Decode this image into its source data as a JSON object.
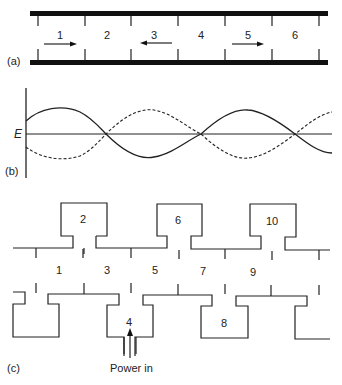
{
  "figure": {
    "panels": [
      {
        "id": "a",
        "label": "(a)",
        "description": "Slow-wave structure with cells and traveling wave directions",
        "cells": [
          {
            "label": "1",
            "arrow": "right"
          },
          {
            "label": "2",
            "arrow": "none"
          },
          {
            "label": "3",
            "arrow": "left"
          },
          {
            "label": "4",
            "arrow": "none"
          },
          {
            "label": "5",
            "arrow": "right"
          },
          {
            "label": "6",
            "arrow": "none"
          }
        ]
      },
      {
        "id": "b",
        "label": "(b)",
        "axis_label": "E",
        "description": "Standing-wave field pattern: solid and dashed sinusoids crossing the E axis",
        "curves": [
          {
            "name": "solid",
            "style": "solid"
          },
          {
            "name": "dashed",
            "style": "dashed"
          }
        ]
      },
      {
        "id": "c",
        "label": "(c)",
        "description": "Coupled-cavity structure with interaction gaps",
        "top_cavities": [
          "2",
          "6",
          "10"
        ],
        "bottom_cavities": [
          "4",
          "8"
        ],
        "gap_labels": [
          "1",
          "3",
          "5",
          "7",
          "9"
        ],
        "input_label": "Power in"
      }
    ]
  }
}
